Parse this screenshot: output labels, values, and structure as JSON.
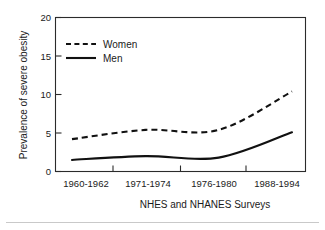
{
  "chart_data": {
    "type": "line",
    "title": "",
    "xlabel": "NHES and NHANES Surveys",
    "ylabel": "Prevalence of severe obesity",
    "categories": [
      "1960-1962",
      "1971-1974",
      "1976-1980",
      "1988-1994"
    ],
    "ylim": [
      0,
      20
    ],
    "yticks": [
      0,
      5,
      10,
      15,
      20
    ],
    "ytick_labels": [
      "0",
      "5",
      "10",
      "15",
      "20"
    ],
    "grid": false,
    "legend_position": "upper-left",
    "series": [
      {
        "name": "Women",
        "style": "dashed",
        "color": "#111111",
        "values": [
          4.2,
          5.4,
          5.4,
          10.4
        ]
      },
      {
        "name": "Men",
        "style": "solid",
        "color": "#111111",
        "values": [
          1.5,
          2.0,
          1.8,
          5.1
        ]
      }
    ]
  },
  "axes": {
    "y_title": "Prevalence of severe obesity",
    "x_title": "NHES and NHANES Surveys",
    "y_tick_0": "0",
    "y_tick_1": "5",
    "y_tick_2": "10",
    "y_tick_3": "15",
    "y_tick_4": "20",
    "x_tick_0": "1960-1962",
    "x_tick_1": "1971-1974",
    "x_tick_2": "1976-1980",
    "x_tick_3": "1988-1994"
  },
  "legend": {
    "women_label": "Women",
    "men_label": "Men"
  },
  "colors": {
    "ink": "#111111",
    "axis": "#2b2b2b",
    "background": "#ffffff",
    "rule": "#c9c9c9"
  }
}
